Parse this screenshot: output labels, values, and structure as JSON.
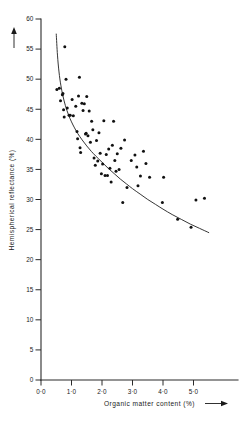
{
  "chart_data": {
    "type": "scatter",
    "title": "",
    "xlabel": "Organic matter content (%)",
    "ylabel": "Hemispherical reflectance (%)",
    "xlim": [
      0,
      57
    ],
    "ylim": [
      0,
      60
    ],
    "grid": false,
    "legend": "none",
    "x_ticks": [
      0,
      10,
      20,
      30,
      40,
      50
    ],
    "x_tick_labels": [
      "0·0",
      "1·0",
      "2·0",
      "3·0",
      "4·0",
      "5·0"
    ],
    "y_ticks": [
      0,
      5,
      10,
      15,
      20,
      25,
      30,
      35,
      40,
      45,
      50,
      55,
      60
    ],
    "y_tick_labels": [
      "0",
      "5",
      "10",
      "15",
      "20",
      "25",
      "30",
      "35",
      "40",
      "45",
      "50",
      "55",
      "60"
    ],
    "xlabel_arrow": "⟶",
    "ylabel_arrow": "⟶",
    "point_marker": "filled-circle",
    "point_color": "#111111",
    "curve_color": "#2b2b2b",
    "axis_color": "#2b2b2b",
    "series": [
      {
        "name": "observations",
        "points": [
          [
            5.2,
            48.3
          ],
          [
            6.0,
            48.5
          ],
          [
            6.4,
            46.4
          ],
          [
            7.0,
            47.4
          ],
          [
            7.2,
            47.6
          ],
          [
            7.4,
            44.9
          ],
          [
            7.6,
            43.7
          ],
          [
            7.8,
            55.4
          ],
          [
            8.2,
            50.0
          ],
          [
            8.6,
            45.2
          ],
          [
            9.2,
            44.0
          ],
          [
            9.6,
            44.0
          ],
          [
            10.2,
            46.6
          ],
          [
            10.6,
            43.9
          ],
          [
            11.4,
            45.5
          ],
          [
            11.8,
            41.3
          ],
          [
            12.0,
            40.1
          ],
          [
            12.3,
            47.2
          ],
          [
            12.6,
            50.3
          ],
          [
            12.8,
            38.6
          ],
          [
            13.0,
            37.8
          ],
          [
            13.4,
            46.0
          ],
          [
            13.8,
            44.8
          ],
          [
            14.2,
            45.9
          ],
          [
            14.6,
            40.9
          ],
          [
            14.8,
            41.0
          ],
          [
            15.0,
            47.1
          ],
          [
            15.4,
            40.6
          ],
          [
            15.8,
            44.7
          ],
          [
            16.2,
            39.5
          ],
          [
            16.6,
            43.0
          ],
          [
            17.0,
            41.6
          ],
          [
            17.4,
            36.9
          ],
          [
            17.8,
            35.7
          ],
          [
            18.2,
            39.8
          ],
          [
            18.6,
            36.4
          ],
          [
            19.0,
            41.1
          ],
          [
            19.4,
            37.7
          ],
          [
            19.8,
            34.3
          ],
          [
            20.2,
            35.9
          ],
          [
            20.6,
            43.1
          ],
          [
            21.0,
            34.0
          ],
          [
            21.4,
            37.5
          ],
          [
            21.8,
            34.0
          ],
          [
            22.2,
            38.4
          ],
          [
            22.6,
            35.2
          ],
          [
            23.0,
            32.9
          ],
          [
            23.4,
            39.0
          ],
          [
            23.8,
            43.0
          ],
          [
            24.2,
            36.5
          ],
          [
            24.6,
            34.7
          ],
          [
            25.0,
            37.6
          ],
          [
            25.6,
            35.0
          ],
          [
            26.2,
            38.5
          ],
          [
            26.8,
            29.5
          ],
          [
            27.4,
            39.9
          ],
          [
            28.2,
            32.0
          ],
          [
            29.6,
            36.5
          ],
          [
            30.8,
            37.4
          ],
          [
            31.4,
            35.4
          ],
          [
            31.8,
            32.3
          ],
          [
            32.6,
            33.9
          ],
          [
            33.6,
            38.0
          ],
          [
            34.4,
            36.0
          ],
          [
            35.6,
            33.7
          ],
          [
            39.8,
            29.5
          ],
          [
            40.2,
            33.7
          ],
          [
            44.8,
            26.7
          ],
          [
            49.2,
            25.4
          ],
          [
            50.8,
            29.9
          ],
          [
            53.6,
            30.2
          ]
        ]
      }
    ],
    "fit_curve": {
      "name": "fitted curve",
      "points": [
        [
          5.0,
          57.5
        ],
        [
          5.4,
          54.0
        ],
        [
          5.9,
          51.2
        ],
        [
          6.5,
          49.0
        ],
        [
          7.2,
          47.2
        ],
        [
          8.0,
          45.6
        ],
        [
          9.0,
          44.1
        ],
        [
          10.0,
          42.9
        ],
        [
          11.0,
          41.9
        ],
        [
          12.0,
          41.0
        ],
        [
          13.5,
          39.9
        ],
        [
          15.0,
          38.9
        ],
        [
          16.5,
          38.0
        ],
        [
          18.0,
          37.2
        ],
        [
          20.0,
          36.2
        ],
        [
          22.0,
          35.2
        ],
        [
          24.0,
          34.3
        ],
        [
          26.0,
          33.4
        ],
        [
          28.0,
          32.6
        ],
        [
          30.0,
          31.8
        ],
        [
          32.5,
          30.9
        ],
        [
          35.0,
          30.0
        ],
        [
          37.5,
          29.2
        ],
        [
          40.0,
          28.4
        ],
        [
          43.0,
          27.5
        ],
        [
          46.0,
          26.7
        ],
        [
          49.0,
          25.9
        ],
        [
          52.0,
          25.2
        ],
        [
          55.0,
          24.5
        ]
      ]
    }
  }
}
